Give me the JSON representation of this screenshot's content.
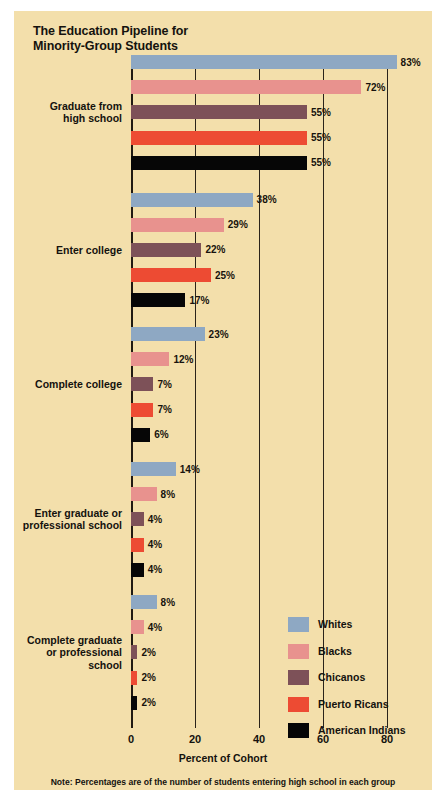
{
  "title": {
    "line1": "The Education Pipeline for",
    "line2": "Minority-Group Students"
  },
  "axis": {
    "xlabel": "Percent of Cohort",
    "ticks": [
      "0",
      "20",
      "40",
      "60",
      "80"
    ]
  },
  "note": "Note: Percentages are of the number of students entering high school in each group",
  "legend": {
    "items": [
      {
        "label": "Whites",
        "color": "#8ea8c3"
      },
      {
        "label": "Blacks",
        "color": "#e8928e"
      },
      {
        "label": "Chicanos",
        "color": "#7d5158"
      },
      {
        "label": "Puerto Ricans",
        "color": "#ed4b33"
      },
      {
        "label": "American Indians",
        "color": "#060606"
      }
    ]
  },
  "chart_data": {
    "type": "bar",
    "title": "The Education Pipeline for Minority-Group Students",
    "xlabel": "Percent of Cohort",
    "ylabel": "",
    "xlim": [
      0,
      80
    ],
    "xticks": [
      0,
      20,
      40,
      60,
      80
    ],
    "grid": true,
    "legend_position": "inside-lower-right",
    "orientation": "horizontal",
    "value_suffix": "%",
    "note": "Note: Percentages are of the number of students entering high school in each group",
    "categories": [
      "Graduate from high school",
      "Enter college",
      "Complete college",
      "Enter graduate or professional school",
      "Complete graduate or professional school"
    ],
    "category_label_lines": [
      [
        "Graduate from",
        "high school"
      ],
      [
        "Enter college"
      ],
      [
        "Complete college"
      ],
      [
        "Enter graduate or",
        "professional school"
      ],
      [
        "Complete graduate",
        "or professional",
        "school"
      ]
    ],
    "series": [
      {
        "name": "Whites",
        "color": "#8ea8c3",
        "values": [
          83,
          38,
          23,
          14,
          8
        ]
      },
      {
        "name": "Blacks",
        "color": "#e8928e",
        "values": [
          72,
          29,
          12,
          8,
          4
        ]
      },
      {
        "name": "Chicanos",
        "color": "#7d5158",
        "values": [
          55,
          22,
          7,
          4,
          2
        ]
      },
      {
        "name": "Puerto Ricans",
        "color": "#ed4b33",
        "values": [
          55,
          25,
          7,
          4,
          2
        ]
      },
      {
        "name": "American Indians",
        "color": "#060606",
        "values": [
          55,
          17,
          6,
          4,
          2
        ]
      }
    ],
    "value_labels": [
      [
        "83%",
        "72%",
        "55%",
        "55%",
        "55%"
      ],
      [
        "38%",
        "29%",
        "22%",
        "25%",
        "17%"
      ],
      [
        "23%",
        "12%",
        "7%",
        "7%",
        "6%"
      ],
      [
        "14%",
        "8%",
        "4%",
        "4%",
        "4%"
      ],
      [
        "8%",
        "4%",
        "2%",
        "2%",
        "2%"
      ]
    ]
  }
}
